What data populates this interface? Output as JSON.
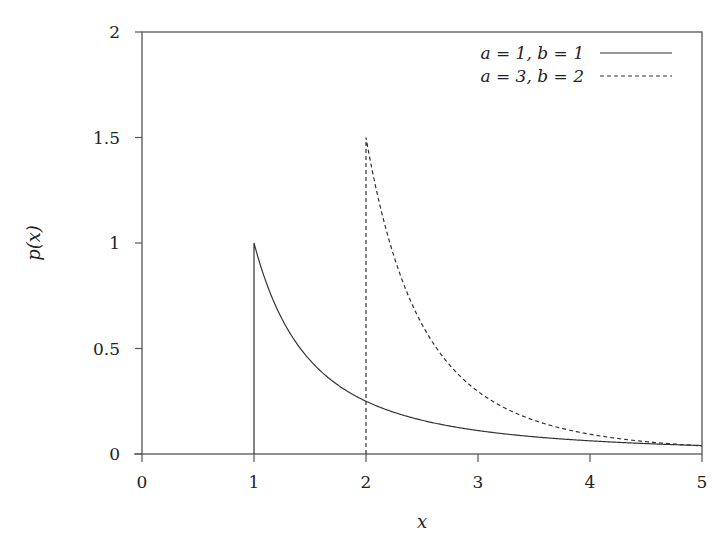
{
  "chart_data": {
    "type": "line",
    "title": "",
    "xlabel": "x",
    "ylabel": "p(x)",
    "xlim": [
      0,
      5
    ],
    "ylim": [
      0,
      2
    ],
    "x_ticks": [
      "0",
      "1",
      "2",
      "3",
      "4",
      "5"
    ],
    "y_ticks": [
      "0",
      "0.5",
      "1",
      "1.5",
      "2"
    ],
    "grid": false,
    "legend_position": "upper right",
    "series": [
      {
        "name": "a = 1, b = 1",
        "style": "solid",
        "color": "#333333",
        "x": [
          1,
          1,
          1.25,
          1.5,
          1.75,
          2,
          2.5,
          3,
          3.5,
          4,
          4.5,
          5
        ],
        "y": [
          0,
          1.0,
          0.64,
          0.444,
          0.327,
          0.25,
          0.16,
          0.111,
          0.082,
          0.0625,
          0.049,
          0.04
        ]
      },
      {
        "name": "a = 3, b = 2",
        "style": "dashed",
        "color": "#333333",
        "x": [
          2,
          2,
          2.25,
          2.5,
          2.75,
          3,
          3.5,
          4,
          4.5,
          5
        ],
        "y": [
          0,
          1.5,
          0.936,
          0.614,
          0.42,
          0.296,
          0.16,
          0.094,
          0.059,
          0.038
        ]
      }
    ]
  },
  "legend": {
    "items": [
      {
        "label": "a = 1, b = 1",
        "style": "solid"
      },
      {
        "label": "a = 3, b = 2",
        "style": "dashed"
      }
    ]
  },
  "axes": {
    "xlabel": "x",
    "ylabel": "p(x)"
  }
}
